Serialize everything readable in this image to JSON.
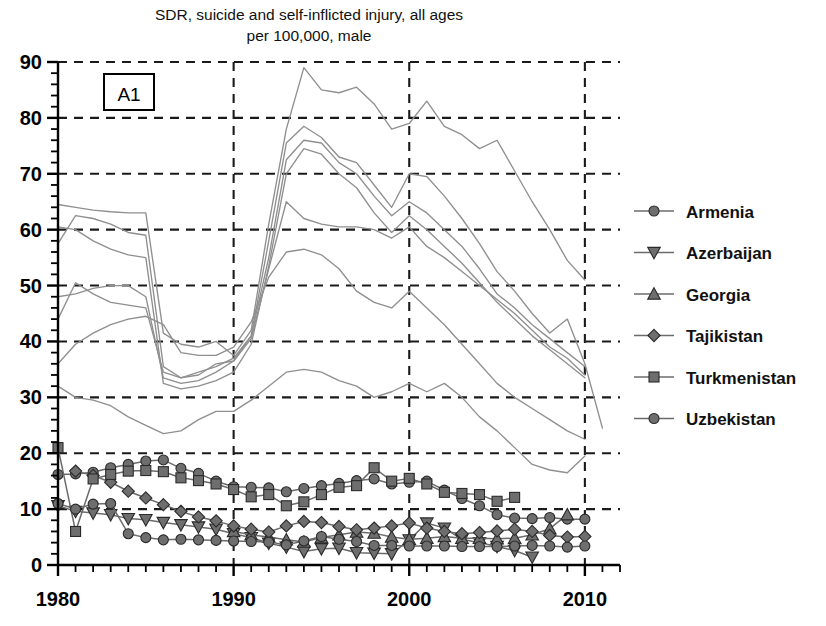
{
  "chart_data": {
    "type": "line",
    "title": "SDR, suicide and self-inflicted injury, all ages",
    "subtitle": "per 100,000, male",
    "panel_label": "A1",
    "xlabel": "",
    "ylabel": "",
    "xlim": [
      1980,
      2012
    ],
    "ylim": [
      0,
      90
    ],
    "ytick_values": [
      0,
      10,
      20,
      30,
      40,
      50,
      60,
      70,
      80,
      90
    ],
    "ytick_labels": [
      "0",
      "10",
      "20",
      "30",
      "40",
      "50",
      "60",
      "70",
      "80",
      "90"
    ],
    "ytick_minor_step": 2,
    "xtick_labeled": [
      1980,
      1990,
      2000,
      2010
    ],
    "xtick_labels": [
      "1980",
      "1990",
      "2000",
      "2010"
    ],
    "xtick_minor_step": 1,
    "grid": "dashed-both-axes",
    "legend_position": "right",
    "marker_color": "#6e6e6e",
    "marker_edge_color": "#2a2a2a",
    "line_color": "#6b6b6b",
    "background_line_color": "#8f8f8f",
    "grid_color": "#1a1a1a",
    "axis_color": "#000000",
    "series": [
      {
        "name": "Armenia",
        "marker": "circle",
        "x": [
          1980,
          1981,
          1982,
          1983,
          1984,
          1985,
          1986,
          1987,
          1988,
          1989,
          1990,
          1991,
          1992,
          1993,
          1994,
          1995,
          1996,
          1997,
          1998,
          1999,
          2000,
          2001,
          2002,
          2003,
          2004,
          2005,
          2006,
          2007,
          2008,
          2009,
          2010
        ],
        "values": [
          16.2,
          16.3,
          16.6,
          17.4,
          18.0,
          18.6,
          18.8,
          17.3,
          16.4,
          15.0,
          14.0,
          13.9,
          13.8,
          13.1,
          13.7,
          14.2,
          14.6,
          15.1,
          15.4,
          14.5,
          14.8,
          15.0,
          13.4,
          11.9,
          10.6,
          9.0,
          8.4,
          8.3,
          8.5,
          8.2,
          8.2
        ]
      },
      {
        "name": "Azerbaijan",
        "marker": "triangle-down",
        "x": [
          1980,
          1981,
          1982,
          1983,
          1984,
          1985,
          1986,
          1987,
          1988,
          1989,
          1990,
          1991,
          1992,
          1993,
          1994,
          1995,
          1996,
          1997,
          1998,
          1999,
          2000,
          2001,
          2002,
          2003,
          2004,
          2005,
          2006,
          2007
        ],
        "values": [
          10.6,
          9.6,
          9.3,
          9.0,
          8.3,
          8.1,
          7.6,
          7.2,
          6.8,
          6.4,
          5.6,
          4.9,
          3.9,
          3.2,
          2.4,
          2.9,
          3.0,
          2.2,
          2.1,
          2.0,
          4.5,
          7.5,
          6.6,
          4.6,
          4.0,
          3.3,
          2.6,
          1.4
        ]
      },
      {
        "name": "Georgia",
        "marker": "triangle-up",
        "x": [
          1990,
          1991,
          1992,
          1993,
          1994,
          1995,
          1996,
          1997,
          1998,
          1999,
          2000,
          2001,
          2002,
          2003,
          2004,
          2005,
          2006,
          2007,
          2008,
          2009
        ],
        "values": [
          6.0,
          5.4,
          5.0,
          4.5,
          4.1,
          4.9,
          5.4,
          5.9,
          5.7,
          5.0,
          4.6,
          4.8,
          5.1,
          4.8,
          4.8,
          4.7,
          4.8,
          5.4,
          6.5,
          9.0
        ]
      },
      {
        "name": "Tajikistan",
        "marker": "diamond",
        "x": [
          1981,
          1982,
          1983,
          1984,
          1985,
          1986,
          1987,
          1988,
          1989,
          1990,
          1991,
          1992,
          1993,
          1994,
          1995,
          1996,
          1997,
          1998,
          1999,
          2000,
          2001,
          2002,
          2003,
          2004,
          2005,
          2006,
          2007,
          2008,
          2009,
          2010
        ],
        "values": [
          16.8,
          16.0,
          14.8,
          13.2,
          12.0,
          10.8,
          9.6,
          8.6,
          7.9,
          7.0,
          6.4,
          5.9,
          7.0,
          7.8,
          7.6,
          6.9,
          6.3,
          6.6,
          7.0,
          7.5,
          6.6,
          6.0,
          5.6,
          5.8,
          6.1,
          6.4,
          6.0,
          5.3,
          5.0,
          5.1
        ]
      },
      {
        "name": "Turkmenistan",
        "marker": "square",
        "x": [
          1980,
          1981,
          1982,
          1983,
          1984,
          1985,
          1986,
          1987,
          1988,
          1989,
          1990,
          1991,
          1992,
          1993,
          1994,
          1995,
          1996,
          1997,
          1998,
          1999,
          2000,
          2001,
          2002,
          2003,
          2004,
          2005,
          2006
        ],
        "values": [
          21.0,
          6.0,
          15.4,
          16.2,
          16.8,
          16.9,
          16.7,
          15.6,
          15.1,
          14.5,
          13.5,
          12.2,
          12.6,
          10.6,
          11.3,
          12.6,
          13.9,
          14.2,
          17.4,
          15.0,
          15.5,
          14.5,
          13.0,
          12.8,
          12.6,
          11.4,
          12.1
        ]
      },
      {
        "name": "Uzbekistan",
        "marker": "circle",
        "x": [
          1980,
          1981,
          1982,
          1983,
          1984,
          1985,
          1986,
          1987,
          1988,
          1989,
          1990,
          1991,
          1992,
          1993,
          1994,
          1995,
          1996,
          1997,
          1998,
          1999,
          2000,
          2001,
          2002,
          2003,
          2004,
          2005,
          2006,
          2007,
          2008,
          2009,
          2010
        ],
        "values": [
          11.0,
          10.0,
          10.9,
          11.0,
          5.6,
          4.9,
          4.5,
          4.6,
          4.5,
          4.4,
          4.3,
          4.2,
          4.1,
          3.6,
          4.3,
          5.1,
          4.6,
          4.2,
          3.5,
          3.5,
          3.4,
          3.4,
          3.4,
          3.3,
          3.3,
          3.3,
          3.4,
          3.5,
          3.4,
          3.2,
          3.4
        ]
      }
    ],
    "background_series": [
      {
        "name": "unlabeled-line-1",
        "x": [
          1980,
          1981,
          1982,
          1983,
          1984,
          1985,
          1986,
          1987,
          1988,
          1989,
          1990,
          1991,
          1992,
          1993,
          1994,
          1995,
          1996,
          1997,
          1998,
          1999,
          2000,
          2001,
          2002,
          2003,
          2004,
          2005,
          2006,
          2007,
          2008,
          2009,
          2010
        ],
        "values": [
          64.5,
          64.0,
          63.5,
          63.2,
          63.0,
          63.0,
          41.5,
          39.5,
          39.0,
          40.0,
          37.5,
          42.0,
          61.0,
          78.0,
          89.0,
          85.0,
          84.5,
          85.5,
          82.5,
          78.0,
          79.0,
          83.0,
          78.5,
          77.0,
          74.5,
          76.0,
          70.5,
          65.0,
          60.0,
          54.5,
          51.0
        ]
      },
      {
        "name": "unlabeled-line-2",
        "x": [
          1980,
          1981,
          1982,
          1983,
          1984,
          1985,
          1986,
          1987,
          1988,
          1989,
          1990,
          1991,
          1992,
          1993,
          1994,
          1995,
          1996,
          1997,
          1998,
          1999,
          2000,
          2001,
          2002,
          2003,
          2004,
          2005,
          2006,
          2007,
          2008,
          2009,
          2010,
          2011
        ],
        "values": [
          57.5,
          62.5,
          62.0,
          61.0,
          59.5,
          59.0,
          35.5,
          33.5,
          34.5,
          35.5,
          37.0,
          41.0,
          58.0,
          75.5,
          78.5,
          76.5,
          73.0,
          72.0,
          68.0,
          64.0,
          70.0,
          69.5,
          66.0,
          62.0,
          57.5,
          52.5,
          49.0,
          45.0,
          41.5,
          44.0,
          36.0,
          24.5
        ]
      },
      {
        "name": "unlabeled-line-3",
        "x": [
          1980,
          1981,
          1982,
          1983,
          1984,
          1985,
          1986,
          1987,
          1988,
          1989,
          1990,
          1991,
          1992,
          1993,
          1994,
          1995,
          1996,
          1997,
          1998,
          1999,
          2000,
          2001,
          2002,
          2003,
          2004,
          2005,
          2006,
          2007,
          2008,
          2009,
          2010
        ],
        "values": [
          48.0,
          48.5,
          49.5,
          50.0,
          50.0,
          48.0,
          33.5,
          32.5,
          33.0,
          34.5,
          36.5,
          41.0,
          55.0,
          72.5,
          76.0,
          75.5,
          72.0,
          70.0,
          66.0,
          62.5,
          65.0,
          63.0,
          60.0,
          57.0,
          53.0,
          48.5,
          46.0,
          43.0,
          40.5,
          38.0,
          35.5
        ]
      },
      {
        "name": "unlabeled-line-4",
        "x": [
          1980,
          1981,
          1982,
          1983,
          1984,
          1985,
          1986,
          1987,
          1988,
          1989,
          1990,
          1991,
          1992,
          1993,
          1994,
          1995,
          1996,
          1997,
          1998,
          1999,
          2000,
          2001,
          2002,
          2003,
          2004,
          2005,
          2006,
          2007,
          2008,
          2009,
          2010
        ],
        "values": [
          44.0,
          50.5,
          48.5,
          47.0,
          46.5,
          46.0,
          34.5,
          33.5,
          34.0,
          36.0,
          36.5,
          40.5,
          53.0,
          65.0,
          62.0,
          61.0,
          60.5,
          60.5,
          60.0,
          58.5,
          60.5,
          57.0,
          55.0,
          52.5,
          50.0,
          47.5,
          45.0,
          42.0,
          39.0,
          37.0,
          34.0
        ]
      },
      {
        "name": "unlabeled-line-5",
        "x": [
          1980,
          1981,
          1982,
          1983,
          1984,
          1985,
          1986,
          1987,
          1988,
          1989,
          1990,
          1991,
          1992,
          1993,
          1994,
          1995,
          1996,
          1997,
          1998,
          1999,
          2000,
          2001,
          2002,
          2003,
          2004,
          2005,
          2006,
          2007,
          2008,
          2009,
          2010
        ],
        "values": [
          36.0,
          39.5,
          41.5,
          43.0,
          44.0,
          44.5,
          43.0,
          38.0,
          37.5,
          37.5,
          39.0,
          43.5,
          51.5,
          56.0,
          56.5,
          55.5,
          53.0,
          49.0,
          47.0,
          46.0,
          49.0,
          46.0,
          43.0,
          39.5,
          36.0,
          32.5,
          30.0,
          28.0,
          26.0,
          24.0,
          22.5
        ]
      },
      {
        "name": "unlabeled-line-6",
        "x": [
          1980,
          1981,
          1982,
          1983,
          1984,
          1985,
          1986,
          1987,
          1988,
          1989,
          1990,
          1991,
          1992,
          1993,
          1994,
          1995,
          1996,
          1997,
          1998,
          1999,
          2000,
          2001,
          2002,
          2003,
          2004,
          2005,
          2006,
          2007,
          2008,
          2009,
          2010
        ],
        "values": [
          32.0,
          30.0,
          29.5,
          28.5,
          26.5,
          25.0,
          23.5,
          24.0,
          26.0,
          27.5,
          27.5,
          29.5,
          32.0,
          34.5,
          35.0,
          34.5,
          33.0,
          32.0,
          30.0,
          31.0,
          32.5,
          31.0,
          32.5,
          30.0,
          26.5,
          24.0,
          21.0,
          18.0,
          17.0,
          16.5,
          19.5
        ]
      },
      {
        "name": "unlabeled-line-7",
        "x": [
          1980,
          1981,
          1982,
          1983,
          1984,
          1985,
          1986,
          1987,
          1988,
          1989,
          1990,
          1991,
          1992,
          1993,
          1994,
          1995,
          1996,
          1997,
          1998,
          1999,
          2000,
          2001,
          2002,
          2003,
          2004,
          2005,
          2006,
          2007,
          2008,
          2009,
          2010
        ],
        "values": [
          60.5,
          60.0,
          58.0,
          56.5,
          55.5,
          55.0,
          32.5,
          31.5,
          32.0,
          33.0,
          34.5,
          39.5,
          53.5,
          70.0,
          74.5,
          73.5,
          70.0,
          67.5,
          63.0,
          59.5,
          62.5,
          60.0,
          57.0,
          54.0,
          50.5,
          47.0,
          44.0,
          41.0,
          38.5,
          36.0,
          33.5
        ]
      }
    ]
  },
  "legend": {
    "items": [
      {
        "label": "Armenia",
        "marker": "circle"
      },
      {
        "label": "Azerbaijan",
        "marker": "triangle-down"
      },
      {
        "label": "Georgia",
        "marker": "triangle-up"
      },
      {
        "label": "Tajikistan",
        "marker": "diamond"
      },
      {
        "label": "Turkmenistan",
        "marker": "square"
      },
      {
        "label": "Uzbekistan",
        "marker": "circle"
      }
    ]
  }
}
